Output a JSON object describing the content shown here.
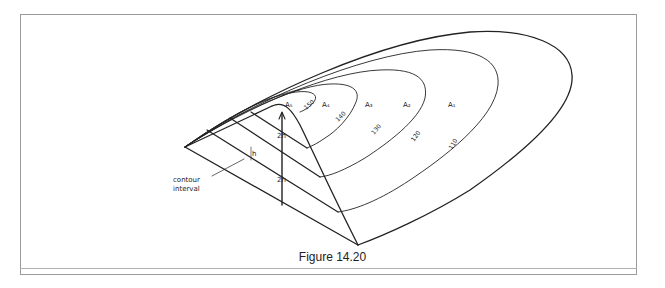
{
  "figure": {
    "caption": "Figure 14.20",
    "region_labels": [
      "A1",
      "A2",
      "A3",
      "A4",
      "A5"
    ],
    "region_display": {
      "A1": "A₁",
      "A2": "A₂",
      "A3": "A₃",
      "A4": "A₄",
      "A5": "A₅"
    },
    "contour_values": [
      "110",
      "120",
      "130",
      "140",
      "150"
    ],
    "height_labels": [
      "2h",
      "2h"
    ],
    "interval_label": "h",
    "annotation": {
      "line1": "contour",
      "line2": "interval"
    }
  }
}
